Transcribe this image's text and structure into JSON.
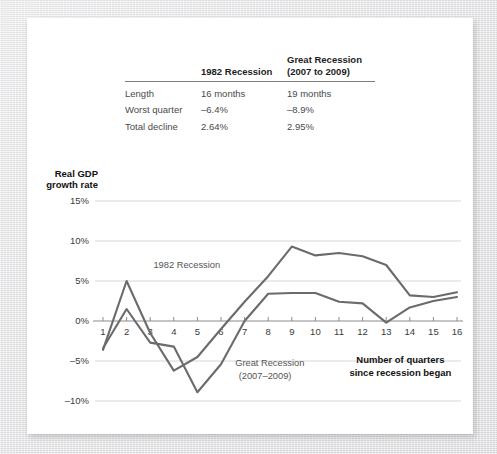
{
  "table": {
    "columns": [
      "",
      "1982 Recession",
      "Great Recession\n(2007 to 2009)"
    ],
    "header_blank": "",
    "header_a": "1982 Recession",
    "header_b_line1": "Great Recession",
    "header_b_line2": "(2007 to 2009)",
    "rows": [
      {
        "label": "Length",
        "a": "16 months",
        "b": "19 months"
      },
      {
        "label": "Worst quarter",
        "a": "–6.4%",
        "b": "–8.9%"
      },
      {
        "label": "Total decline",
        "a": "2.64%",
        "b": "2.95%"
      }
    ]
  },
  "chart_data": {
    "type": "line",
    "title": "",
    "xlabel": "Number of quarters since recession began",
    "ylabel": "Real GDP growth rate",
    "x": [
      1,
      2,
      3,
      4,
      5,
      6,
      7,
      8,
      9,
      10,
      11,
      12,
      13,
      14,
      15,
      16
    ],
    "xlim": [
      1,
      16
    ],
    "ylim": [
      -10,
      15
    ],
    "yticks": [
      15,
      10,
      5,
      0,
      -5,
      -10
    ],
    "ytick_labels": [
      "15%",
      "10%",
      "5%",
      "0%",
      "–5%",
      "–10%"
    ],
    "xticks": [
      1,
      2,
      3,
      4,
      5,
      6,
      7,
      8,
      9,
      10,
      11,
      12,
      13,
      14,
      15,
      16
    ],
    "xtick_labels": [
      "1",
      "2",
      "3",
      "4",
      "5",
      "6",
      "7",
      "8",
      "9",
      "10",
      "11",
      "12",
      "13",
      "14",
      "15",
      "16"
    ],
    "grid": true,
    "legend": "annotations",
    "series": [
      {
        "name": "1982 Recession",
        "color": "#6b6b6b",
        "values": [
          -3.6,
          5.0,
          -1.5,
          -6.2,
          -4.5,
          -1.0,
          2.4,
          5.6,
          9.3,
          8.2,
          8.5,
          8.1,
          7.0,
          3.2,
          3.0,
          3.6
        ]
      },
      {
        "name": "Great Recession (2007–2009)",
        "color": "#6b6b6b",
        "values": [
          -3.4,
          1.5,
          -2.7,
          -3.2,
          -8.9,
          -5.4,
          0.0,
          3.4,
          3.5,
          3.5,
          2.4,
          2.2,
          -0.2,
          1.7,
          2.5,
          3.0
        ]
      }
    ],
    "annotations": [
      {
        "text": "1982 Recession",
        "x": 4.55,
        "y": 6.6,
        "style": "plain",
        "align": "middle"
      },
      {
        "text": "Great Recession",
        "x": 6.6,
        "y": -5.6,
        "style": "plain",
        "align": "start"
      },
      {
        "text": "(2007–2009)",
        "x": 6.75,
        "y": -7.2,
        "style": "plain",
        "align": "start"
      },
      {
        "text": "Number of quarters",
        "x": 13.6,
        "y": -5.3,
        "style": "strong",
        "align": "middle"
      },
      {
        "text": "since recession began",
        "x": 13.6,
        "y": -6.9,
        "style": "strong",
        "align": "middle"
      }
    ]
  }
}
